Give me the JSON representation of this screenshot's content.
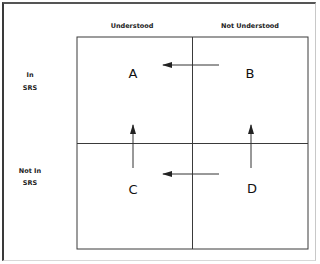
{
  "diagram": {
    "columns": [
      {
        "label": "Understood",
        "x": 132
      },
      {
        "label": "Not Understood",
        "x": 250
      }
    ],
    "rows": [
      {
        "label_lines": [
          "In",
          "SRS"
        ],
        "y": 80
      },
      {
        "label_lines": [
          "Not In",
          "SRS"
        ],
        "y": 176
      }
    ],
    "cells": [
      {
        "id": "A",
        "label": "A",
        "x": 133,
        "y": 78
      },
      {
        "id": "B",
        "label": "B",
        "x": 250,
        "y": 78
      },
      {
        "id": "C",
        "label": "C",
        "x": 133,
        "y": 194
      },
      {
        "id": "D",
        "label": "D",
        "x": 252,
        "y": 193
      }
    ],
    "arrows": [
      {
        "from": "B",
        "to": "A",
        "direction": "left"
      },
      {
        "from": "C",
        "to": "A",
        "direction": "up"
      },
      {
        "from": "D",
        "to": "B",
        "direction": "up"
      },
      {
        "from": "D",
        "to": "C",
        "direction": "left"
      }
    ],
    "colors": {
      "line": "#333333",
      "text": "#111111",
      "background": "#ffffff"
    }
  }
}
